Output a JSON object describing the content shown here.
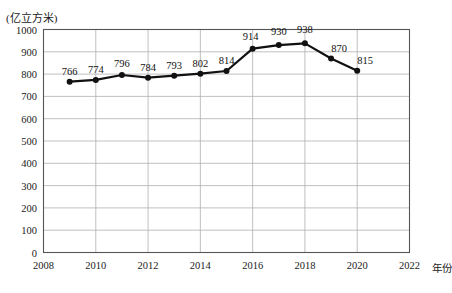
{
  "chart_data": {
    "type": "line",
    "title": "",
    "subtitle": "",
    "xlabel": "年份",
    "ylabel": "",
    "unit_label": "(亿立方米)",
    "x": [
      2009,
      2010,
      2011,
      2012,
      2013,
      2014,
      2015,
      2016,
      2017,
      2018,
      2019,
      2020
    ],
    "values": [
      766,
      774,
      796,
      784,
      793,
      802,
      814,
      914,
      930,
      938,
      870,
      815
    ],
    "point_labels": [
      "766",
      "774",
      "796",
      "784",
      "793",
      "802",
      "814",
      "914",
      "930",
      "938",
      "870",
      "815"
    ],
    "xlim": [
      2008,
      2022
    ],
    "ylim": [
      0,
      1000
    ],
    "xticks": [
      2008,
      2010,
      2012,
      2014,
      2016,
      2018,
      2020,
      2022
    ],
    "xtick_labels": [
      "2008",
      "2010",
      "2012",
      "2014",
      "2016",
      "2018",
      "2020",
      "2022"
    ],
    "yticks": [
      0,
      100,
      200,
      300,
      400,
      500,
      600,
      700,
      800,
      900,
      1000
    ],
    "ytick_labels": [
      "0",
      "100",
      "200",
      "300",
      "400",
      "500",
      "600",
      "700",
      "800",
      "900",
      "1000"
    ],
    "grid": true,
    "legend": false,
    "series_color": "#111111",
    "grid_color": "#b0b0b0",
    "axis_color": "#555555",
    "marker": "circle",
    "marker_size": 6,
    "line_width": 2.2
  }
}
